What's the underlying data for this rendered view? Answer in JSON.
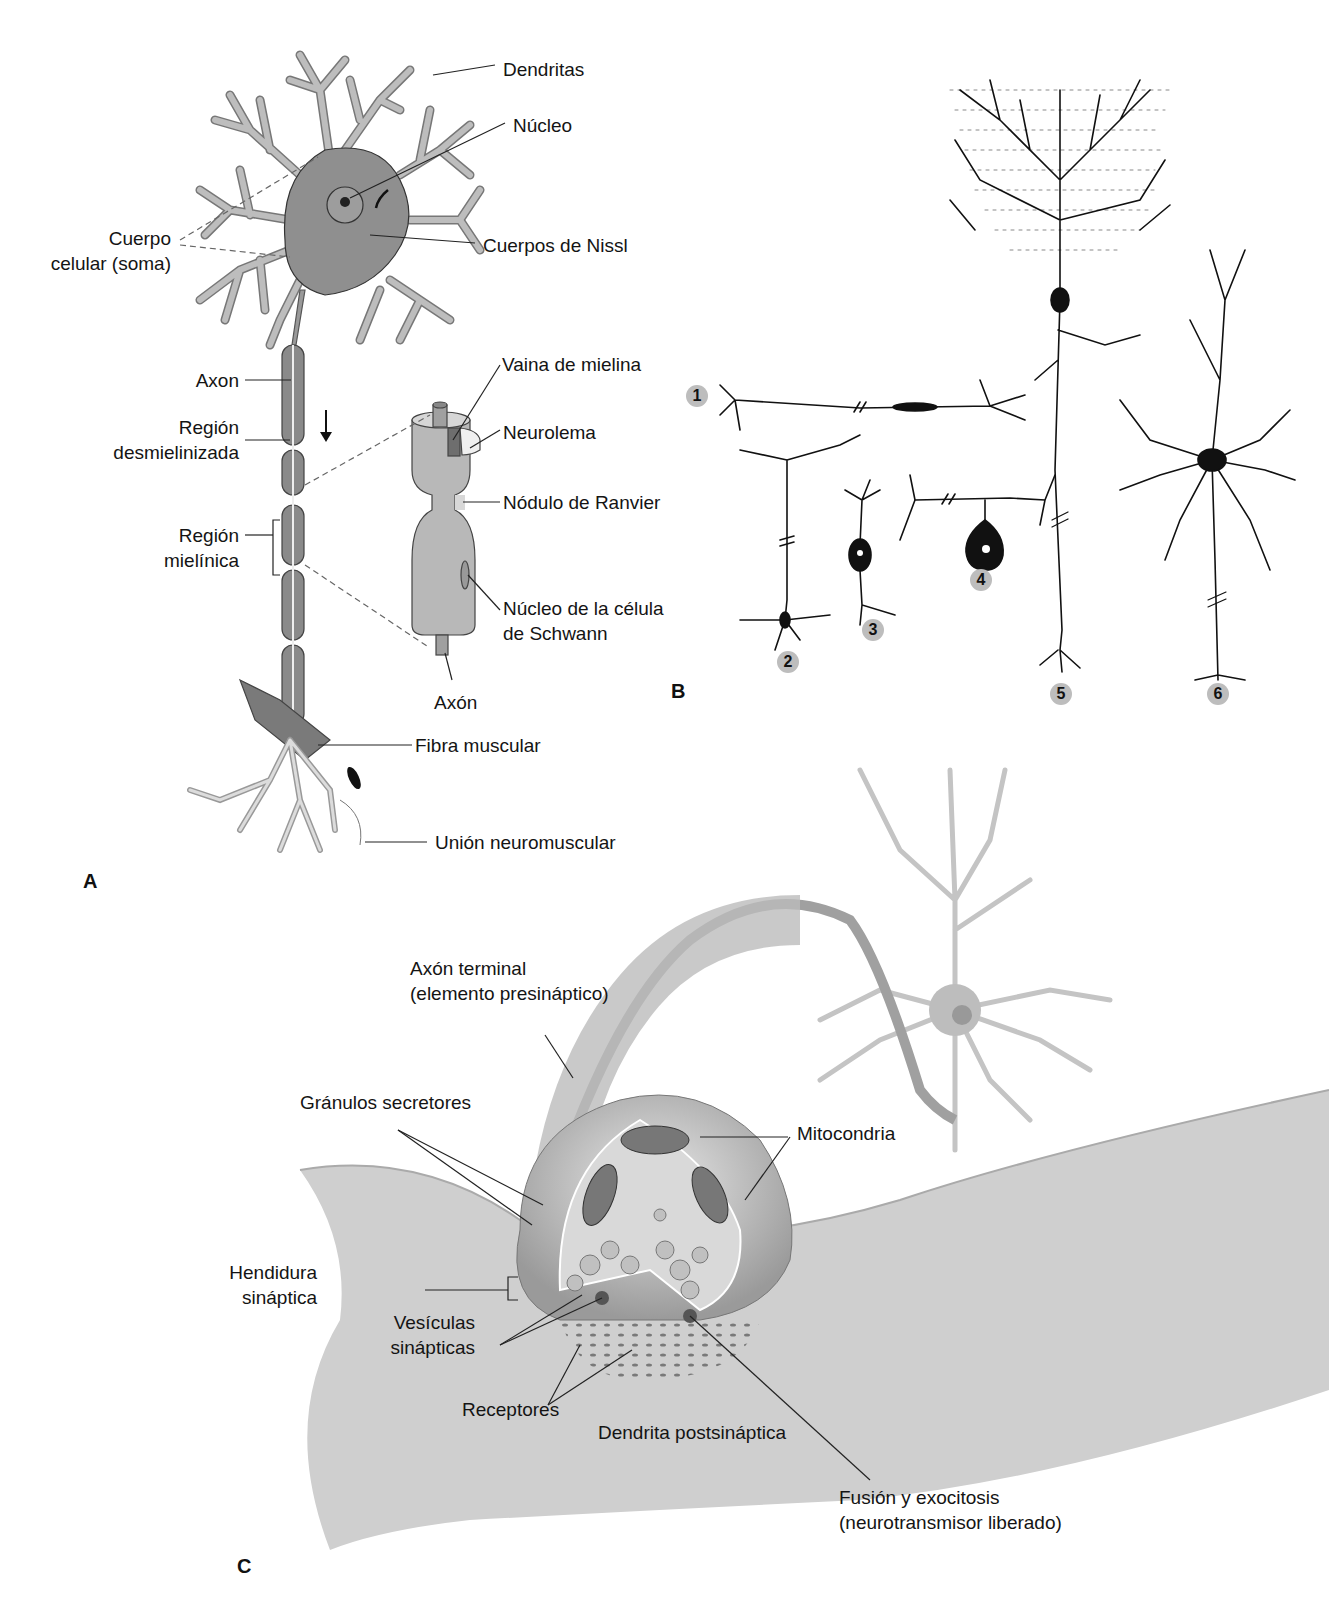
{
  "figure": {
    "panels": {
      "A": {
        "letter": "A",
        "labels": {
          "dendritas": "Dendritas",
          "nucleo": "Núcleo",
          "cuerpo_celular_1": "Cuerpo",
          "cuerpo_celular_2": "celular (soma)",
          "cuerpos_nissl": "Cuerpos de Nissl",
          "axon": "Axon",
          "region_desm_1": "Región",
          "region_desm_2": "desmielinizada",
          "region_miel_1": "Región",
          "region_miel_2": "mielínica",
          "vaina_mielina": "Vaina de mielina",
          "neurolema": "Neurolema",
          "nodulo_ranvier": "Nódulo de Ranvier",
          "nucleo_schwann_1": "Núcleo de la célula",
          "nucleo_schwann_2": "de Schwann",
          "axon_detail": "Axón",
          "fibra_muscular": "Fibra muscular",
          "union_neuromuscular": "Unión neuromuscular"
        }
      },
      "B": {
        "letter": "B",
        "neuron_numbers": [
          "1",
          "2",
          "3",
          "4",
          "5",
          "6"
        ]
      },
      "C": {
        "letter": "C",
        "labels": {
          "axon_terminal_1": "Axón terminal",
          "axon_terminal_2": "(elemento presináptico)",
          "granulos": "Gránulos secretores",
          "mitocondria": "Mitocondria",
          "hendidura_1": "Hendidura",
          "hendidura_2": "sináptica",
          "vesiculas_1": "Vesículas",
          "vesiculas_2": "sinápticas",
          "receptores": "Receptores",
          "dendrita_post": "Dendrita postsináptica",
          "fusion_1": "Fusión y exocitosis",
          "fusion_2": "(neurotransmisor liberado)"
        }
      }
    },
    "colors": {
      "neuron_fill": "#bdbdbd",
      "soma_fill": "#8a8a8a",
      "ink": "#111111",
      "badge": "#bdbdbd",
      "synapse_shade": "#c8c8c8"
    }
  }
}
